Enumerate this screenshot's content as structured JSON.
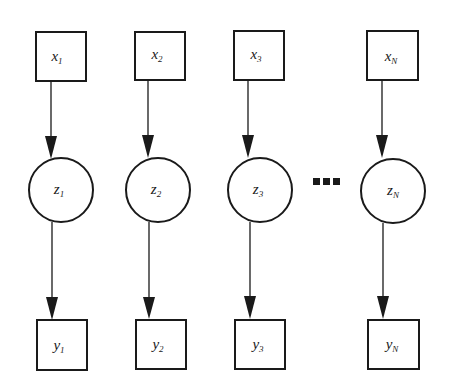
{
  "diagram": {
    "type": "graphical-model",
    "colors": {
      "stroke": "#1a1a1a",
      "background": "#ffffff"
    },
    "columns": [
      {
        "x": {
          "base": "x",
          "sub": "1"
        },
        "z": {
          "base": "z",
          "sub": "1"
        },
        "y": {
          "base": "y",
          "sub": "1"
        }
      },
      {
        "x": {
          "base": "x",
          "sub": "2"
        },
        "z": {
          "base": "z",
          "sub": "2"
        },
        "y": {
          "base": "y",
          "sub": "2"
        }
      },
      {
        "x": {
          "base": "x",
          "sub": "3"
        },
        "z": {
          "base": "z",
          "sub": "3"
        },
        "y": {
          "base": "y",
          "sub": "3"
        }
      },
      {
        "x": {
          "base": "x",
          "sub": "N"
        },
        "z": {
          "base": "z",
          "sub": "N"
        },
        "y": {
          "base": "y",
          "sub": "N"
        }
      }
    ],
    "ellipsis": "▪▪▪",
    "edges": [
      [
        "x1",
        "z1"
      ],
      [
        "z1",
        "y1"
      ],
      [
        "x2",
        "z2"
      ],
      [
        "z2",
        "y2"
      ],
      [
        "x3",
        "z3"
      ],
      [
        "z3",
        "y3"
      ],
      [
        "xN",
        "zN"
      ],
      [
        "zN",
        "yN"
      ]
    ]
  }
}
